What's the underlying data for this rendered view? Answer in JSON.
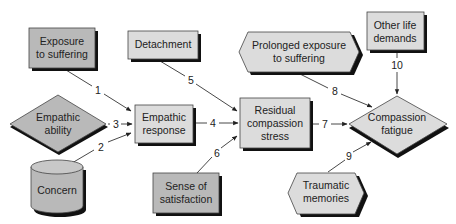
{
  "diagram": {
    "colors": {
      "dark_fill": "#b9b9b9",
      "light_fill": "#dcdcdc",
      "shadow": "#111111",
      "line": "#333333"
    },
    "nodes": [
      {
        "id": "exposure",
        "shape": "rect",
        "lines": [
          "Exposure",
          "to suffering"
        ]
      },
      {
        "id": "detachment",
        "shape": "rect",
        "lines": [
          "Detachment"
        ]
      },
      {
        "id": "prolonged",
        "shape": "hexagon",
        "lines": [
          "Prolonged exposure",
          "to suffering"
        ]
      },
      {
        "id": "other",
        "shape": "rect",
        "lines": [
          "Other life",
          "demands"
        ]
      },
      {
        "id": "ability",
        "shape": "diamond",
        "lines": [
          "Empathic",
          "ability"
        ]
      },
      {
        "id": "response",
        "shape": "rect",
        "lines": [
          "Empathic",
          "response"
        ]
      },
      {
        "id": "residual",
        "shape": "rect",
        "lines": [
          "Residual",
          "compassion",
          "stress"
        ]
      },
      {
        "id": "fatigue",
        "shape": "diamond",
        "lines": [
          "Compassion",
          "fatigue"
        ]
      },
      {
        "id": "concern",
        "shape": "cylinder",
        "lines": [
          "Concern"
        ]
      },
      {
        "id": "satisfaction",
        "shape": "rect",
        "lines": [
          "Sense of",
          "satisfaction"
        ]
      },
      {
        "id": "traumatic",
        "shape": "hexagon",
        "lines": [
          "Traumatic",
          "memories"
        ]
      }
    ],
    "edges": [
      {
        "from": "exposure",
        "to": "response",
        "label": "1"
      },
      {
        "from": "concern",
        "to": "response",
        "label": "2"
      },
      {
        "from": "ability",
        "to": "response",
        "label": "3"
      },
      {
        "from": "response",
        "to": "residual",
        "label": "4"
      },
      {
        "from": "detachment",
        "to": "residual",
        "label": "5"
      },
      {
        "from": "satisfaction",
        "to": "residual",
        "label": "6"
      },
      {
        "from": "residual",
        "to": "fatigue",
        "label": "7"
      },
      {
        "from": "prolonged",
        "to": "fatigue",
        "label": "8"
      },
      {
        "from": "traumatic",
        "to": "fatigue",
        "label": "9"
      },
      {
        "from": "other",
        "to": "fatigue",
        "label": "10"
      }
    ]
  }
}
